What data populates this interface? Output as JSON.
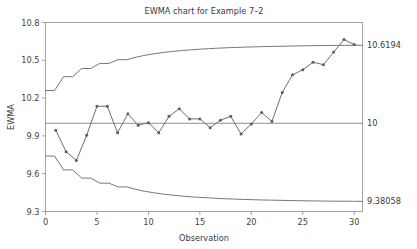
{
  "chart_data": {
    "type": "line",
    "title": "EWMA chart for Example 7–2",
    "xlabel": "Observation",
    "ylabel": "EWMA",
    "xlim": [
      0,
      30.8
    ],
    "ylim": [
      9.3,
      10.8
    ],
    "xticks": [
      0,
      5,
      10,
      15,
      20,
      25,
      30
    ],
    "xticklabels": [
      "0",
      "5",
      "10",
      "15",
      "20",
      "25",
      "30"
    ],
    "yticks": [
      9.3,
      9.6,
      9.9,
      10.2,
      10.5,
      10.8
    ],
    "yticklabels": [
      "9.3",
      "9.6",
      "9.9",
      "10.2",
      "10.5",
      "10.8"
    ],
    "grid": false,
    "legend": "none",
    "line_color": "#6f6f6f",
    "marker_color": "#5e5e5e",
    "limit_color": "#707070",
    "center_color": "#8a8a8a",
    "x": [
      1,
      2,
      3,
      4,
      5,
      6,
      7,
      8,
      9,
      10,
      11,
      12,
      13,
      14,
      15,
      16,
      17,
      18,
      19,
      20,
      21,
      22,
      23,
      24,
      25,
      26,
      27,
      28,
      29,
      30
    ],
    "series": [
      {
        "name": "EWMA",
        "values": [
          9.945,
          9.775,
          9.705,
          9.905,
          10.135,
          10.135,
          9.925,
          10.075,
          9.985,
          10.005,
          9.925,
          10.055,
          10.115,
          10.035,
          10.035,
          9.965,
          10.025,
          10.055,
          9.915,
          9.995,
          10.085,
          10.015,
          10.245,
          10.385,
          10.425,
          10.485,
          10.465,
          10.565,
          10.665,
          10.625
        ]
      }
    ],
    "control_limits": {
      "center": {
        "value": 10,
        "label": "10"
      },
      "upper": {
        "value": 10.6194,
        "label": "10.6194",
        "points": [
          10.26,
          10.26,
          10.37,
          10.37,
          10.435,
          10.435,
          10.475,
          10.475,
          10.505,
          10.505,
          10.525,
          10.54,
          10.552,
          10.562,
          10.57,
          10.577,
          10.583,
          10.588,
          10.592,
          10.596,
          10.5995,
          10.602,
          10.6045,
          10.6065,
          10.6085,
          10.61,
          10.6115,
          10.613,
          10.6145,
          10.6155,
          10.6165,
          10.6175,
          10.618,
          10.6185,
          10.619,
          10.6194
        ]
      },
      "lower": {
        "value": 9.38058,
        "label": "9.38058",
        "points": [
          9.74,
          9.74,
          9.63,
          9.63,
          9.565,
          9.565,
          9.525,
          9.525,
          9.495,
          9.495,
          9.475,
          9.46,
          9.448,
          9.438,
          9.43,
          9.423,
          9.417,
          9.412,
          9.408,
          9.404,
          9.4005,
          9.398,
          9.3955,
          9.3935,
          9.3915,
          9.39,
          9.3885,
          9.387,
          9.3855,
          9.3845,
          9.3835,
          9.3825,
          9.382,
          9.3815,
          9.381,
          9.38058
        ]
      }
    }
  }
}
